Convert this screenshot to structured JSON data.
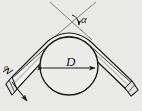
{
  "figure": {
    "type": "engineering-diagram",
    "background_color": "#e9e9e7",
    "line_color": "#1b1b1b",
    "labels": {
      "diameter": "D",
      "angle": "α",
      "edge_mark": "a"
    },
    "geometry": {
      "circle": {
        "cx": 69,
        "cy": 66,
        "r": 29,
        "label": "D"
      },
      "dimension_line": {
        "y": 68,
        "x1": 41,
        "x2": 97,
        "label": "D"
      },
      "apex": {
        "x": 69,
        "y": 30
      },
      "angle_arc": {
        "cx": 71,
        "cy": 24,
        "r": 9,
        "label": "α"
      },
      "bend_angle_label": "α"
    },
    "elements": [
      {
        "name": "mandrel-circle",
        "kind": "circle"
      },
      {
        "name": "bent-pipe",
        "kind": "tube"
      },
      {
        "name": "diameter-dimension",
        "kind": "dimension"
      },
      {
        "name": "angle-construction-lines",
        "kind": "construction"
      },
      {
        "name": "angle-arc",
        "kind": "arc"
      },
      {
        "name": "left-pipe-end",
        "kind": "section-end"
      },
      {
        "name": "right-pipe-end",
        "kind": "section-end"
      },
      {
        "name": "section-arrow",
        "kind": "arrow"
      }
    ]
  }
}
